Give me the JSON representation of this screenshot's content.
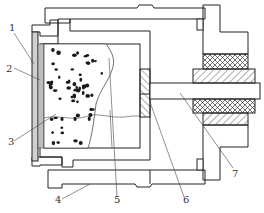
{
  "figure": {
    "type": "mechanical cross-section",
    "colors": {
      "line": "#222222",
      "hatch": "#333333",
      "stipple_fill": "#f2f2f2",
      "gray_plate": "#c8c8c8",
      "background": "#ffffff"
    },
    "labels": [
      {
        "id": "1",
        "text": "1"
      },
      {
        "id": "2",
        "text": "2"
      },
      {
        "id": "3",
        "text": "3"
      },
      {
        "id": "4",
        "text": "4"
      },
      {
        "id": "5",
        "text": "5"
      },
      {
        "id": "6",
        "text": "6"
      },
      {
        "id": "7",
        "text": "7"
      }
    ],
    "regions": [
      {
        "name": "outer-housing",
        "pattern": "diagonal-hatch"
      },
      {
        "name": "insulation-layer",
        "pattern": "stipple"
      },
      {
        "name": "front-plate",
        "pattern": "gray"
      },
      {
        "name": "specimen-with-particles",
        "pattern": "dots"
      },
      {
        "name": "piston-plate",
        "pattern": "diagonal-hatch"
      },
      {
        "name": "shaft",
        "pattern": "plain"
      },
      {
        "name": "seal-packing",
        "pattern": "cross-hatch"
      },
      {
        "name": "end-flange",
        "pattern": "diagonal-hatch"
      }
    ]
  }
}
